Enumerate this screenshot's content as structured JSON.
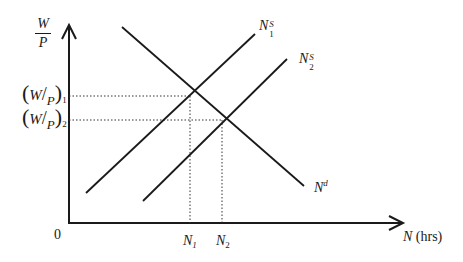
{
  "diagram": {
    "type": "labor-market-supply-demand",
    "y_axis": {
      "label_num": "W",
      "label_den": "P"
    },
    "x_axis": {
      "label_var": "N",
      "label_unit": "(hrs)"
    },
    "origin": "0",
    "y_ticks": [
      {
        "label_num": "W",
        "label_den": "P",
        "sub": "1"
      },
      {
        "label_num": "W",
        "label_den": "P",
        "sub": "2"
      }
    ],
    "x_ticks": [
      {
        "label": "N",
        "sub": "1"
      },
      {
        "label": "N",
        "sub": "2"
      }
    ],
    "curves": [
      {
        "name": "N",
        "sup": "S",
        "sub": "1",
        "kind": "supply"
      },
      {
        "name": "N",
        "sup": "S",
        "sub": "2",
        "kind": "supply"
      },
      {
        "name": "N",
        "sup": "d",
        "sub": "",
        "kind": "demand"
      }
    ],
    "colors": {
      "line": "#1a1a1a",
      "guide": "#333333",
      "background": "#ffffff"
    }
  }
}
